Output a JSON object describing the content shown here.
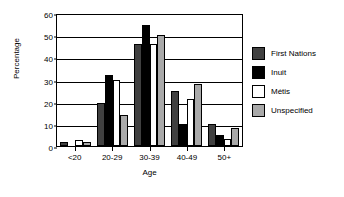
{
  "chart_data": {
    "type": "bar",
    "title": "",
    "xlabel": "Age",
    "ylabel": "Percentage",
    "categories": [
      "<20",
      "20-29",
      "30-39",
      "40-49",
      "50+"
    ],
    "ylim": [
      0,
      60
    ],
    "yticks": [
      0,
      10,
      20,
      30,
      40,
      50,
      60
    ],
    "grid": true,
    "legend_position": "right",
    "series": [
      {
        "name": "First Nations",
        "color": "#404040",
        "values": [
          1.7,
          19.5,
          46,
          24.8,
          10
        ]
      },
      {
        "name": "Inuit",
        "color": "#000000",
        "values": [
          0,
          32,
          54.5,
          10,
          5
        ]
      },
      {
        "name": "Métis",
        "color": "#ffffff",
        "values": [
          2.5,
          30,
          46,
          21,
          3
        ]
      },
      {
        "name": "Unspecified",
        "color": "#a9a9a9",
        "values": [
          2,
          14,
          50,
          28,
          8
        ]
      }
    ]
  }
}
